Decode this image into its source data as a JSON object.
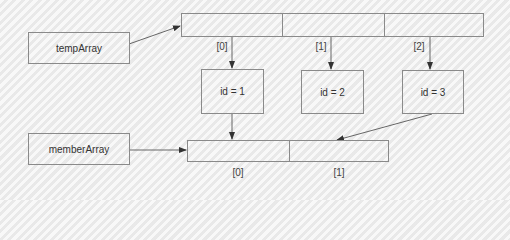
{
  "diagram": {
    "variables": [
      {
        "id": "tempArray",
        "label": "tempArray"
      },
      {
        "id": "memberArray",
        "label": "memberArray"
      }
    ],
    "temp_array": {
      "cells": 3,
      "indices": [
        "[0]",
        "[1]",
        "[2]"
      ]
    },
    "objects": [
      {
        "label": "id = 1"
      },
      {
        "label": "id = 2"
      },
      {
        "label": "id = 3"
      }
    ],
    "member_array": {
      "cells": 2,
      "indices": [
        "[0]",
        "[1]"
      ]
    },
    "edges": [
      {
        "from": "tempArray",
        "to": "temp_array"
      },
      {
        "from": "temp_array[0]",
        "to": "id = 1"
      },
      {
        "from": "temp_array[1]",
        "to": "id = 2"
      },
      {
        "from": "temp_array[2]",
        "to": "id = 3"
      },
      {
        "from": "memberArray",
        "to": "member_array"
      },
      {
        "from": "id = 1",
        "to": "member_array[0]"
      },
      {
        "from": "id = 3",
        "to": "member_array[1]"
      }
    ],
    "colors": {
      "stroke": "#8a8a8a",
      "arrow": "#555555",
      "text": "#333333",
      "background": "#efefef"
    }
  }
}
